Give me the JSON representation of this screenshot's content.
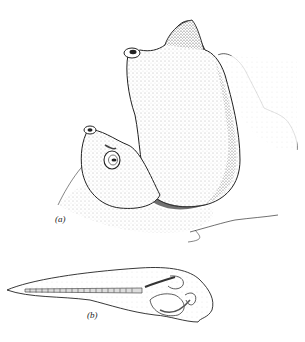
{
  "figure": {
    "panel_a": {
      "label": "(a)",
      "subject": "adult tunicates (sea squirts) attached to substrate"
    },
    "panel_b": {
      "label": "(b)",
      "subject": "tunicate tadpole larva"
    }
  },
  "colors": {
    "ink": "#222222",
    "background": "#ffffff",
    "stipple": "#9a9a9a"
  }
}
